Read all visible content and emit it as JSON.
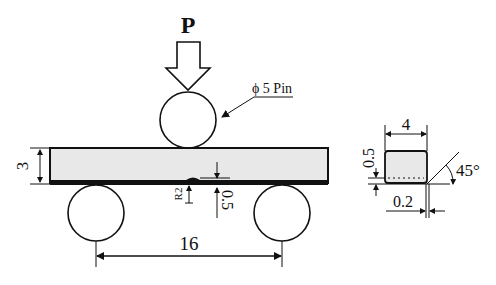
{
  "figure": {
    "type": "three-point bending test specimen diagram",
    "load": {
      "label": "P"
    },
    "loading_pin": {
      "label": "ϕ 5 Pin",
      "diameter": "5"
    },
    "specimen": {
      "thickness_label": "3",
      "notch_radius_label": "R2",
      "notch_depth_label": "0.5",
      "fill_color": "#e8e8e8",
      "edge_color": "#111111"
    },
    "supports": {
      "span_label": "16",
      "count": 2
    },
    "cross_section": {
      "width_label": "4",
      "coating_thickness_label": "0.5",
      "chamfer_label": "0.2",
      "angle_label": "45°"
    }
  }
}
